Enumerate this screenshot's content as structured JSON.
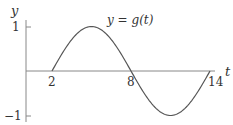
{
  "chart_data": {
    "type": "line",
    "title": "",
    "annotation": "y = g(t)",
    "xlabel": "t",
    "ylabel": "y",
    "x_ticks": [
      "2",
      "8",
      "14"
    ],
    "y_ticks": [
      "1",
      "−1"
    ],
    "xlim": [
      -0.5,
      14.6
    ],
    "ylim": [
      -1,
      1
    ],
    "grid": false,
    "legend": null,
    "series": [
      {
        "name": "g(t)",
        "description": "sine wave, period 12, zero at t=2, max 1 at t=5, zero at t=8, min -1 at t=11, zero at t=14",
        "x": [
          2,
          3,
          4,
          5,
          6,
          7,
          8,
          9,
          10,
          11,
          12,
          13,
          14
        ],
        "values": [
          0,
          0.5,
          0.866,
          1,
          0.866,
          0.5,
          0,
          -0.5,
          -0.866,
          -1,
          -0.866,
          -0.5,
          0
        ]
      }
    ]
  },
  "labels": {
    "y_axis": "y",
    "t_axis": "t",
    "curve": "y = g(t)",
    "tick_y_pos": "1",
    "tick_y_neg": "−1",
    "tick_t_2": "2",
    "tick_t_8": "8",
    "tick_t_14": "14"
  },
  "colors": {
    "axis": "#888888",
    "curve": "#555555",
    "text": "#333333"
  }
}
